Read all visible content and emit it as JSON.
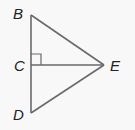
{
  "diagram": {
    "type": "geometry-triangle",
    "colors": {
      "background": "#f8f8f8",
      "stroke": "#6a6a6a",
      "label": "#222222"
    },
    "points": {
      "B": {
        "label": "B",
        "x": 31,
        "y": 15
      },
      "C": {
        "label": "C",
        "x": 31,
        "y": 65
      },
      "D": {
        "label": "D",
        "x": 31,
        "y": 113
      },
      "E": {
        "label": "E",
        "x": 104,
        "y": 65
      }
    },
    "segments": [
      "BD",
      "BE",
      "DE",
      "CE"
    ],
    "right_angle_at": "C"
  }
}
